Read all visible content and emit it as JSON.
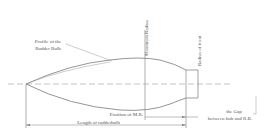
{
  "diagram": {
    "colors": {
      "line": "#8a8a8a",
      "text": "#555555",
      "background": "#ffffff"
    },
    "labels": {
      "profile": [
        "Profile of the",
        "Rudder Bulb"
      ],
      "max_radius": "Maximum Radius",
      "radius_front": "Radius of front",
      "position_mr": "Position of M.R.",
      "length": "Length of rudderbulb",
      "gap": [
        "the Gap",
        "between hub and R.B."
      ]
    }
  }
}
